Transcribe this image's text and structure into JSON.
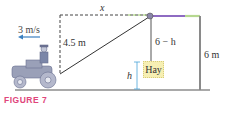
{
  "figure": {
    "caption": "FIGURE 7",
    "labels": {
      "x": "x",
      "speed": "3 m/s",
      "height_pulley": "4.5 m",
      "rope_vertical": "6 − h",
      "hay_height": "h",
      "post_height": "6 m",
      "hay": "Hay"
    },
    "colors": {
      "caption": "#e0457b",
      "arrow": "#3a7fc0",
      "beam": "#8e6bc2",
      "hay_box": "#f6efb3",
      "h_arrow": "#4aa3d8"
    }
  }
}
